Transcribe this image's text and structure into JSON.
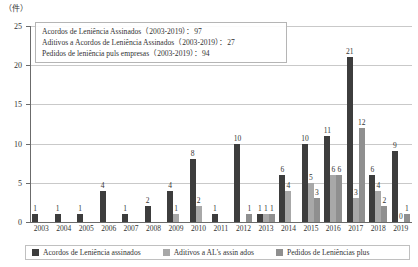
{
  "chart_data": {
    "type": "bar",
    "title": "",
    "xlabel": "",
    "ylabel": "(件)",
    "ylim": [
      0,
      25
    ],
    "yticks": [
      0,
      5,
      10,
      15,
      20,
      25
    ],
    "grid": true,
    "legend_position": "bottom",
    "categories": [
      "2003",
      "2004",
      "2005",
      "2006",
      "2007",
      "2008",
      "2009",
      "2010",
      "2011",
      "2012",
      "2013",
      "2014",
      "2015",
      "2016",
      "2017",
      "2018",
      "2019"
    ],
    "series": [
      {
        "name": "Acordos de Leniência assinados",
        "color": "#3d3d3d",
        "values": [
          1,
          1,
          1,
          4,
          1,
          2,
          4,
          8,
          1,
          10,
          1,
          6,
          10,
          11,
          21,
          6,
          9
        ],
        "labels": [
          "1",
          "1",
          "1",
          "4",
          "1",
          "2",
          "4",
          "8",
          "1",
          "10",
          "1",
          "6",
          "10",
          "11",
          "21",
          "6",
          "9"
        ]
      },
      {
        "name": "Aditivos a AL's assin ados",
        "color": "#a8a8a8",
        "values": [
          0,
          0,
          0,
          0,
          0,
          0,
          1,
          2,
          0,
          0,
          1,
          4,
          5,
          6,
          3,
          4,
          0
        ],
        "labels": [
          "",
          "",
          "",
          "",
          "",
          "",
          "1",
          "2",
          "",
          "",
          "1",
          "4",
          "5",
          "6",
          "3",
          "4",
          "0"
        ]
      },
      {
        "name": "Pedidos de Leniências plus",
        "color": "#8f8f8f",
        "values": [
          0,
          0,
          0,
          0,
          0,
          0,
          0,
          0,
          0,
          1,
          1,
          0,
          3,
          6,
          12,
          2,
          1
        ],
        "labels": [
          "",
          "",
          "",
          "",
          "",
          "",
          "",
          "",
          "",
          "1",
          "1",
          "",
          "3",
          "6",
          "12",
          "2",
          "1"
        ]
      }
    ],
    "annotations": [
      "Acordos de Leniência Assinados（2003-2019）：97",
      "Aditivos a Acordos de Leniência Assinados（2003-2019）：27",
      "Pedidos de leniência puls empresas（2003-2019）：94"
    ]
  },
  "axis": {
    "unit": "（件）"
  }
}
